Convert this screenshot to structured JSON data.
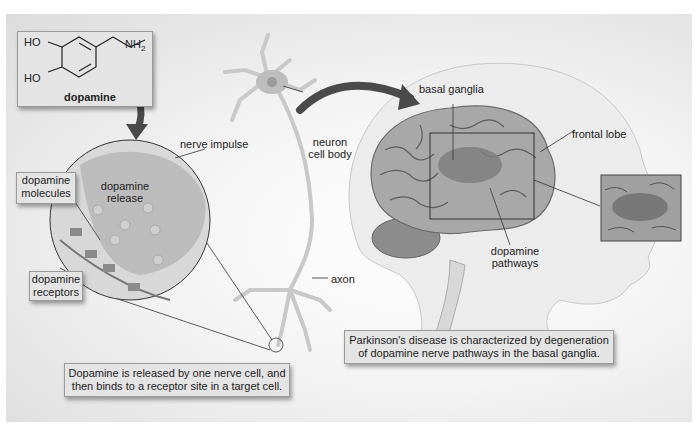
{
  "figure": {
    "molecule": {
      "name": "dopamine",
      "groups": [
        "HO",
        "HO",
        "NH2"
      ]
    },
    "labels": {
      "nerve_impulse": "nerve impulse",
      "dopamine_release_1": "dopamine",
      "dopamine_release_2": "release",
      "dopamine_molecules_1": "dopamine",
      "dopamine_molecules_2": "molecules",
      "dopamine_receptors_1": "dopamine",
      "dopamine_receptors_2": "receptors",
      "neuron_cell_body_1": "neuron",
      "neuron_cell_body_2": "cell body",
      "axon": "axon",
      "basal_ganglia": "basal ganglia",
      "frontal_lobe": "frontal lobe",
      "dopamine_pathways_1": "dopamine",
      "dopamine_pathways_2": "pathways"
    },
    "captions": {
      "release_line1": "Dopamine is released by one nerve cell, and",
      "release_line2": "then binds to a receptor site in a target cell.",
      "parkinsons_line1": "Parkinson's disease is characterized by degeneration",
      "parkinsons_line2": "of dopamine nerve pathways in the basal ganglia."
    },
    "colors": {
      "background": "#e8e8e8",
      "box_fill": "#e4e4e4",
      "arrow": "#555555",
      "brain": "#9a9a9a",
      "head": "#eeeeee"
    }
  }
}
